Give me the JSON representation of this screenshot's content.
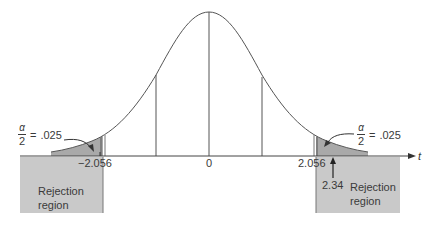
{
  "diagram": {
    "type": "t-distribution two-tailed rejection regions",
    "axis": {
      "variable_label": "t",
      "tick_labels": {
        "left_critical": "−2.056",
        "center": "0",
        "right_critical": "2.056"
      }
    },
    "tails": {
      "left": {
        "alpha_numerator": "α",
        "alpha_denominator": "2",
        "equals": "=",
        "value": ".025"
      },
      "right": {
        "alpha_numerator": "α",
        "alpha_denominator": "2",
        "equals": "=",
        "value": ".025"
      }
    },
    "rejection_regions": {
      "left": {
        "line1": "Rejection",
        "line2": "region"
      },
      "right": {
        "line1": "Rejection",
        "line2": "region"
      }
    },
    "test_statistic": {
      "value": "2.34"
    },
    "colors": {
      "region_fill": "#c9c9c9",
      "tail_fill": "#a9a9a9",
      "line": "#555555",
      "text": "#3a3a3a"
    }
  }
}
